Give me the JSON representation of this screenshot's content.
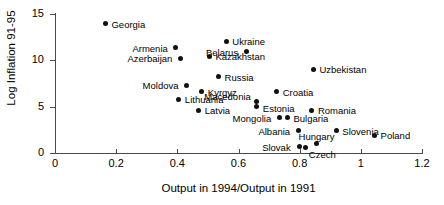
{
  "chart_data": {
    "type": "scatter",
    "title": "",
    "xlabel": "Output in 1994/Output in 1991",
    "ylabel": "Log Inflation 91-95",
    "xlim": [
      0,
      1.2
    ],
    "ylim": [
      0,
      15
    ],
    "xticks": [
      "0",
      "0.2",
      "0.4",
      "0.6",
      "0.8",
      "1",
      "1.2"
    ],
    "xtick_values": [
      0,
      0.2,
      0.4,
      0.6,
      0.8,
      1.0,
      1.2
    ],
    "yticks": [
      "0",
      "5",
      "10",
      "15"
    ],
    "ytick_values": [
      0,
      5,
      10,
      15
    ],
    "grid": false,
    "legend": "none",
    "marker_color": "#111111",
    "points": [
      {
        "label": "Georgia",
        "x": 0.165,
        "y": 13.9,
        "lx": 6,
        "ly": -4,
        "align": "left"
      },
      {
        "label": "Armenia",
        "x": 0.395,
        "y": 11.3,
        "lx": -8,
        "ly": -4,
        "align": "right"
      },
      {
        "label": "Azerbaijan",
        "x": 0.41,
        "y": 10.2,
        "lx": -8,
        "ly": -4,
        "align": "right"
      },
      {
        "label": "Ukraine",
        "x": 0.56,
        "y": 12.0,
        "lx": 6,
        "ly": -4,
        "align": "left"
      },
      {
        "label": "Belarus",
        "x": 0.625,
        "y": 10.9,
        "lx": -8,
        "ly": -4,
        "align": "right"
      },
      {
        "label": "Kazakhstan",
        "x": 0.505,
        "y": 10.4,
        "lx": 6,
        "ly": -4,
        "align": "left"
      },
      {
        "label": "Russia",
        "x": 0.535,
        "y": 8.2,
        "lx": 6,
        "ly": -4,
        "align": "left"
      },
      {
        "label": "Uzbekistan",
        "x": 0.845,
        "y": 9.0,
        "lx": 6,
        "ly": -4,
        "align": "left"
      },
      {
        "label": "Moldova",
        "x": 0.43,
        "y": 7.3,
        "lx": -8,
        "ly": -4,
        "align": "right"
      },
      {
        "label": "Kyrgyz",
        "x": 0.48,
        "y": 6.6,
        "lx": 6,
        "ly": -4,
        "align": "left"
      },
      {
        "label": "Lithuania",
        "x": 0.405,
        "y": 5.8,
        "lx": 6,
        "ly": -4,
        "align": "left"
      },
      {
        "label": "Latvia",
        "x": 0.47,
        "y": 4.6,
        "lx": 6,
        "ly": -4,
        "align": "left"
      },
      {
        "label": "Croatia",
        "x": 0.725,
        "y": 6.6,
        "lx": 6,
        "ly": -4,
        "align": "left"
      },
      {
        "label": "Macedonia",
        "x": 0.66,
        "y": 5.5,
        "lx": -6,
        "ly": -10,
        "align": "right"
      },
      {
        "label": "Estonia",
        "x": 0.66,
        "y": 5.0,
        "lx": 6,
        "ly": -3,
        "align": "left"
      },
      {
        "label": "Romania",
        "x": 0.84,
        "y": 4.6,
        "lx": 6,
        "ly": -4,
        "align": "left"
      },
      {
        "label": "Mongolia",
        "x": 0.733,
        "y": 3.8,
        "lx": -8,
        "ly": -4,
        "align": "right"
      },
      {
        "label": "Bulgaria",
        "x": 0.76,
        "y": 3.8,
        "lx": 6,
        "ly": -4,
        "align": "left"
      },
      {
        "label": "Albania",
        "x": 0.795,
        "y": 2.4,
        "lx": -8,
        "ly": -4,
        "align": "right"
      },
      {
        "label": "Slovenia",
        "x": 0.92,
        "y": 2.4,
        "lx": 6,
        "ly": -4,
        "align": "left"
      },
      {
        "label": "Poland",
        "x": 1.045,
        "y": 1.9,
        "lx": 6,
        "ly": -4,
        "align": "left"
      },
      {
        "label": "Hungary",
        "x": 0.855,
        "y": 1.0,
        "lx": 0,
        "ly": -12,
        "align": "center"
      },
      {
        "label": "Slovak",
        "x": 0.8,
        "y": 0.65,
        "lx": -9,
        "ly": -4,
        "align": "right"
      },
      {
        "label": "Czech",
        "x": 0.82,
        "y": 0.55,
        "lx": 3,
        "ly": 2,
        "align": "left"
      }
    ]
  }
}
